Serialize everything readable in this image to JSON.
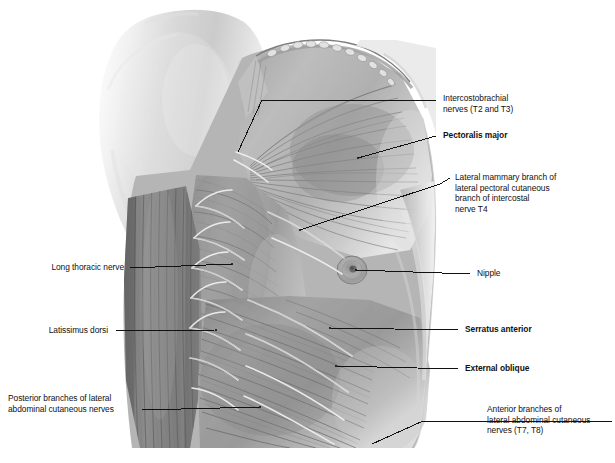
{
  "figure": {
    "background_color": "#ffffff",
    "ink_color": "#111111",
    "leader_line_color": "#1a1a1a"
  },
  "labels": [
    {
      "id": "intercostobrachial-nerves",
      "text": "Intercostobrachial\nnerves (T2 and T3)",
      "bold": false,
      "side": "right"
    },
    {
      "id": "pectoralis-major",
      "text": "Pectoralis major",
      "bold": true,
      "side": "right"
    },
    {
      "id": "lateral-mammary-branch",
      "text": "Lateral mammary branch of\nlateral pectoral cutaneous\nbranch of intercostal\nnerve T4",
      "bold": false,
      "side": "right"
    },
    {
      "id": "nipple",
      "text": "Nipple",
      "bold": false,
      "side": "right"
    },
    {
      "id": "serratus-anterior",
      "text": "Serratus anterior",
      "bold": true,
      "side": "right"
    },
    {
      "id": "external-oblique",
      "text": "External oblique",
      "bold": true,
      "side": "right"
    },
    {
      "id": "anterior-branches",
      "text": "Anterior branches of\nlateral abdominal cutaneous\nnerves (T7, T8)",
      "bold": false,
      "side": "right"
    },
    {
      "id": "long-thoracic-nerve",
      "text": "Long thoracic nerve",
      "bold": false,
      "side": "left"
    },
    {
      "id": "latissimus-dorsi",
      "text": "Latissimus dorsi",
      "bold": false,
      "side": "left"
    },
    {
      "id": "posterior-branches",
      "text": "Posterior branches of lateral\nabdominal cutaneous nerves",
      "bold": false,
      "side": "left"
    }
  ],
  "structures": [
    {
      "id": "upper-arm",
      "name": "Upper arm (medial surface)"
    },
    {
      "id": "pectoralis-major-muscle",
      "name": "Pectoralis major muscle"
    },
    {
      "id": "serratus-anterior-muscle",
      "name": "Serratus anterior digitations"
    },
    {
      "id": "latissimus-dorsi-muscle",
      "name": "Latissimus dorsi muscle"
    },
    {
      "id": "external-oblique-muscle",
      "name": "External oblique muscle"
    },
    {
      "id": "nipple-structure",
      "name": "Nipple and areola"
    },
    {
      "id": "cut-skin-edge",
      "name": "Reflected cut edge of skin and fascia"
    }
  ]
}
